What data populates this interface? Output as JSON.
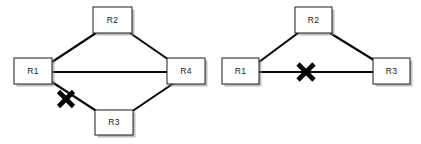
{
  "figure": {
    "background_color": "#ffffff",
    "width": 421,
    "height": 144
  },
  "style": {
    "node_fill": "#ffffff",
    "node_stroke": "#1c1c1c",
    "link_color": "#0a0a0a",
    "xmark_color": "#000000",
    "shadow_color": "#8a8a8a",
    "label_color": "#1a1a1a"
  },
  "diagrams": [
    {
      "id": "left-diagram",
      "name": "four-router-diamond-topology",
      "node_count": 4,
      "nodes": [
        {
          "id": "L-R1",
          "label": "R1",
          "role": "left-vertex",
          "x": 14,
          "y": 58,
          "w": 38,
          "h": 26
        },
        {
          "id": "L-R2",
          "label": "R2",
          "role": "top-vertex",
          "x": 93,
          "y": 7,
          "w": 39,
          "h": 26
        },
        {
          "id": "L-R4",
          "label": "R4",
          "role": "right-vertex",
          "x": 167,
          "y": 58,
          "w": 38,
          "h": 26
        },
        {
          "id": "L-R3",
          "label": "R3",
          "role": "bottom-vertex",
          "x": 95,
          "y": 110,
          "w": 38,
          "h": 25
        }
      ],
      "links": [
        {
          "id": "L-link-R1-R2",
          "from": "R1",
          "to": "R2",
          "kind": "diagonal",
          "status": "up"
        },
        {
          "id": "L-link-R2-R4",
          "from": "R2",
          "to": "R4",
          "kind": "diagonal",
          "status": "up"
        },
        {
          "id": "L-link-R1-R4",
          "from": "R1",
          "to": "R4",
          "kind": "horizontal",
          "status": "up"
        },
        {
          "id": "L-link-R1-R3",
          "from": "R1",
          "to": "R3",
          "kind": "diagonal",
          "status": "failed"
        },
        {
          "id": "L-link-R3-R4",
          "from": "R3",
          "to": "R4",
          "kind": "diagonal",
          "status": "up"
        }
      ],
      "failure_marks": [
        {
          "id": "L-xmark",
          "symbol": "X",
          "on_link": "L-link-R1-R3",
          "x": 66,
          "y": 99,
          "size": 17
        }
      ]
    },
    {
      "id": "right-diagram",
      "name": "three-router-triangle-topology",
      "node_count": 3,
      "nodes": [
        {
          "id": "R-R1",
          "label": "R1",
          "role": "left-vertex",
          "x": 222,
          "y": 58,
          "w": 37,
          "h": 26
        },
        {
          "id": "R-R2",
          "label": "R2",
          "role": "top-vertex",
          "x": 295,
          "y": 7,
          "w": 37,
          "h": 26
        },
        {
          "id": "R-R3",
          "label": "R3",
          "role": "right-vertex",
          "x": 373,
          "y": 58,
          "w": 37,
          "h": 26
        }
      ],
      "links": [
        {
          "id": "R-link-R1-R2",
          "from": "R1",
          "to": "R2",
          "kind": "diagonal",
          "status": "up"
        },
        {
          "id": "R-link-R2-R3",
          "from": "R2",
          "to": "R3",
          "kind": "diagonal",
          "status": "up"
        },
        {
          "id": "R-link-R1-R3",
          "from": "R1",
          "to": "R3",
          "kind": "horizontal",
          "status": "failed"
        }
      ],
      "failure_marks": [
        {
          "id": "R-xmark",
          "symbol": "X",
          "on_link": "R-link-R1-R3",
          "x": 306,
          "y": 72,
          "size": 18
        }
      ]
    }
  ]
}
